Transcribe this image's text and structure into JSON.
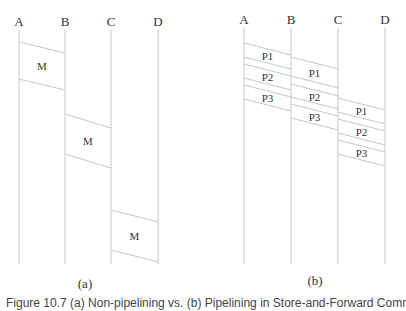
{
  "figure": {
    "caption": "Figure 10.7  (a) Non-pipelining vs. (b) Pipelining in Store-and-Forward Communication Ne",
    "line_color": "#c8c8c8",
    "text_color": "#333333"
  },
  "panel_a": {
    "label": "(a)",
    "nodes": [
      {
        "name": "A",
        "x": 19
      },
      {
        "name": "B",
        "x": 65
      },
      {
        "name": "C",
        "x": 111
      },
      {
        "name": "D",
        "x": 158
      }
    ],
    "messages": [
      {
        "label": "M",
        "from": "A",
        "to": "B",
        "top": [
          42,
          53
        ],
        "bottom": [
          79,
          90
        ]
      },
      {
        "label": "M",
        "from": "B",
        "to": "C",
        "top": [
          114,
          128
        ],
        "bottom": [
          154,
          168
        ]
      },
      {
        "label": "M",
        "from": "C",
        "to": "D",
        "top": [
          210,
          222
        ],
        "bottom": [
          250,
          262
        ]
      }
    ]
  },
  "panel_b": {
    "label": "(b)",
    "nodes": [
      {
        "name": "A",
        "x": 244
      },
      {
        "name": "B",
        "x": 291
      },
      {
        "name": "C",
        "x": 338
      },
      {
        "name": "D",
        "x": 385
      }
    ],
    "packets": [
      {
        "label": "P1",
        "from": "A",
        "to": "B",
        "top": [
          43,
          55
        ],
        "bottom": [
          57,
          69
        ]
      },
      {
        "label": "P2",
        "from": "A",
        "to": "B",
        "top": [
          64,
          76
        ],
        "bottom": [
          78,
          90
        ]
      },
      {
        "label": "P3",
        "from": "A",
        "to": "B",
        "top": [
          85,
          97
        ],
        "bottom": [
          99,
          111
        ]
      },
      {
        "label": "P1",
        "from": "B",
        "to": "C",
        "top": [
          57,
          69
        ],
        "bottom": [
          76,
          88
        ]
      },
      {
        "label": "P2",
        "from": "B",
        "to": "C",
        "top": [
          84,
          96
        ],
        "bottom": [
          97,
          109
        ]
      },
      {
        "label": "P3",
        "from": "B",
        "to": "C",
        "top": [
          104,
          116
        ],
        "bottom": [
          118,
          130
        ]
      },
      {
        "label": "P1",
        "from": "C",
        "to": "D",
        "top": [
          98,
          110
        ],
        "bottom": [
          112,
          124
        ]
      },
      {
        "label": "P2",
        "from": "C",
        "to": "D",
        "top": [
          119,
          131
        ],
        "bottom": [
          133,
          145
        ]
      },
      {
        "label": "P3",
        "from": "C",
        "to": "D",
        "top": [
          140,
          152
        ],
        "bottom": [
          154,
          166
        ]
      }
    ]
  }
}
